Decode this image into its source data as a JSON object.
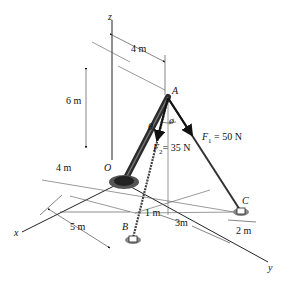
{
  "figure": {
    "axes": {
      "x": "x",
      "y": "y",
      "z": "z"
    },
    "points": {
      "origin": "O",
      "A": "A",
      "B": "B",
      "C": "C"
    },
    "dimensions": {
      "top_4m": "4 m",
      "height_6m": "6 m",
      "left_4m": "4 m",
      "x_5m": "5 m",
      "y_1m": "1 m",
      "y_3m": "3m",
      "c_2m": "2 m"
    },
    "forces": {
      "F1": {
        "symbol": "F",
        "sub": "1",
        "value": " = 50 N"
      },
      "F2": {
        "symbol": "F",
        "sub": "2",
        "value": "= 35 N"
      }
    },
    "angles": {
      "theta": "θ",
      "phi": "ø"
    }
  }
}
